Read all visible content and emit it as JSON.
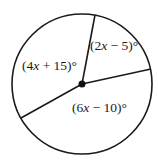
{
  "diagram": {
    "type": "circle-with-central-angles",
    "circle": {
      "cx": 82,
      "cy": 84,
      "r": 70,
      "stroke": "#1a1a1a"
    },
    "center_point": {
      "x": 82,
      "y": 84,
      "r": 3.5
    },
    "radii": [
      {
        "name": "radius-top",
        "x2": 95,
        "y2": 15
      },
      {
        "name": "radius-right",
        "x2": 151,
        "y2": 69
      },
      {
        "name": "radius-lower-left",
        "x2": 21,
        "y2": 118
      }
    ],
    "angles": [
      {
        "name": "angle-top-right",
        "pre": "(2",
        "var": "x",
        "post": " − 5)°",
        "x": 90,
        "y": 50
      },
      {
        "name": "angle-left",
        "pre": "(4",
        "var": "x",
        "post": " + 15)°",
        "x": 22,
        "y": 70
      },
      {
        "name": "angle-bottom",
        "pre": "(6",
        "var": "x",
        "post": " − 10)°",
        "x": 72,
        "y": 112
      }
    ]
  }
}
